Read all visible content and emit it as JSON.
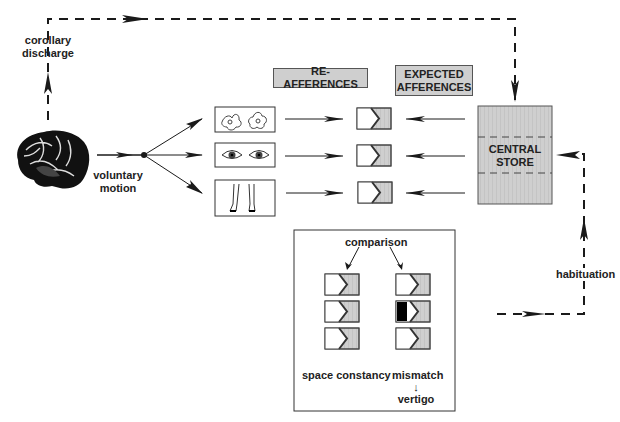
{
  "diagram": {
    "type": "flow-diagram",
    "title": "",
    "labels": {
      "corollary_discharge_line1": "corollary",
      "corollary_discharge_line2": "discharge",
      "voluntary_motion_line1": "voluntary",
      "voluntary_motion_line2": "motion",
      "re_afferences": "RE-AFFERENCES",
      "expected_afferences_line1": "EXPECTED",
      "expected_afferences_line2": "AFFERENCES",
      "central_store_line1": "CENTRAL",
      "central_store_line2": "STORE",
      "habituation": "habituation",
      "comparison": "comparison",
      "space_constancy": "space constancy",
      "mismatch": "mismatch",
      "mismatch_arrow": "↓",
      "vertigo": "vertigo"
    },
    "nodes": [
      {
        "id": "brain",
        "kind": "image",
        "icon": "brain-icon"
      },
      {
        "id": "vestibular",
        "kind": "sensory-box",
        "icon": "vestibular-labyrinth-icon"
      },
      {
        "id": "visual",
        "kind": "sensory-box",
        "icon": "eyes-icon"
      },
      {
        "id": "somatosensory",
        "kind": "sensory-box",
        "icon": "legs-icon"
      },
      {
        "id": "comparator-1",
        "kind": "comparator"
      },
      {
        "id": "comparator-2",
        "kind": "comparator"
      },
      {
        "id": "comparator-3",
        "kind": "comparator"
      },
      {
        "id": "central-store",
        "kind": "store",
        "sections": 3
      }
    ],
    "edges": [
      {
        "from": "brain",
        "to": "central-store",
        "style": "dashed",
        "label": "corollary discharge"
      },
      {
        "from": "brain",
        "to": "branch-node",
        "style": "solid",
        "label": "voluntary motion"
      },
      {
        "from": "branch-node",
        "to": "vestibular",
        "style": "solid"
      },
      {
        "from": "branch-node",
        "to": "visual",
        "style": "solid"
      },
      {
        "from": "branch-node",
        "to": "somatosensory",
        "style": "solid"
      },
      {
        "from": "vestibular",
        "to": "comparator-1",
        "style": "solid"
      },
      {
        "from": "visual",
        "to": "comparator-2",
        "style": "solid"
      },
      {
        "from": "somatosensory",
        "to": "comparator-3",
        "style": "solid"
      },
      {
        "from": "central-store",
        "to": "comparator-1",
        "style": "solid"
      },
      {
        "from": "central-store",
        "to": "comparator-2",
        "style": "solid"
      },
      {
        "from": "central-store",
        "to": "comparator-3",
        "style": "solid"
      },
      {
        "from": "comparison-panel",
        "to": "central-store",
        "style": "dashed",
        "label": "habituation"
      }
    ],
    "comparison_panel": {
      "left_column": {
        "label": "space constancy",
        "comparators": [
          "match",
          "match",
          "match"
        ]
      },
      "right_column": {
        "label": "mismatch",
        "result": "vertigo",
        "comparators": [
          "match",
          "mismatch",
          "match"
        ]
      }
    },
    "colors": {
      "fill_gray": "#cfcfcf",
      "line": "#1a1a1a",
      "mismatch_block": "#000000"
    }
  }
}
